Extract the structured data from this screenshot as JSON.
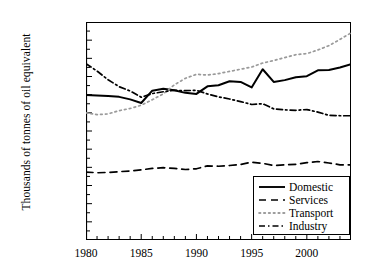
{
  "chart_data": {
    "type": "line",
    "title": "",
    "xlabel": "",
    "ylabel": "Thousands of tonnes of oil equivalent",
    "xlim": [
      1980,
      2004
    ],
    "ylim": [
      0,
      60000
    ],
    "ytick_values": [
      0,
      5000,
      10000,
      15000,
      20000,
      25000,
      30000,
      35000,
      40000,
      45000,
      50000,
      55000,
      60000
    ],
    "ytick_labels": [
      "0",
      "5000",
      "10000",
      "15000",
      "20000",
      "25000",
      "30000",
      "35000",
      "40000",
      "45000",
      "50000",
      "55000",
      "60000"
    ],
    "ytick_minor_step": 2500,
    "xtick_values": [
      1980,
      1985,
      1990,
      1995,
      2000
    ],
    "xtick_labels": [
      "1980",
      "1985",
      "1990",
      "1995",
      "2000"
    ],
    "xtick_minor_step": 1,
    "grid": false,
    "legend_position": "lower right",
    "x": [
      1980,
      1981,
      1982,
      1983,
      1984,
      1985,
      1986,
      1987,
      1988,
      1989,
      1990,
      1991,
      1992,
      1993,
      1994,
      1995,
      1996,
      1997,
      1998,
      1999,
      2000,
      2001,
      2002,
      2003,
      2004
    ],
    "series": [
      {
        "name": "Domestic",
        "style": "solid",
        "color": "#000000",
        "values": [
          39900,
          39800,
          39600,
          39400,
          38700,
          37700,
          41100,
          41600,
          41200,
          40500,
          40200,
          42300,
          42600,
          43700,
          43500,
          42000,
          47000,
          43500,
          44000,
          44800,
          45100,
          46700,
          46800,
          47500,
          48400
        ]
      },
      {
        "name": "Services",
        "style": "dashed",
        "color": "#000000",
        "values": [
          18700,
          18500,
          18600,
          18800,
          19000,
          19300,
          19700,
          19900,
          19700,
          19400,
          19600,
          20400,
          20300,
          20500,
          20800,
          21400,
          21100,
          20500,
          20700,
          20800,
          21300,
          21600,
          21200,
          20700,
          20700
        ]
      },
      {
        "name": "Transport",
        "style": "dotted",
        "color": "#9a9a9a",
        "values": [
          35000,
          34500,
          34700,
          35600,
          36200,
          37100,
          38600,
          40200,
          42700,
          44500,
          45600,
          45400,
          45800,
          46400,
          47000,
          47600,
          48700,
          49400,
          50200,
          51000,
          51300,
          52300,
          53500,
          55200,
          57000
        ]
      },
      {
        "name": "Industry",
        "style": "dashdot",
        "color": "#000000",
        "values": [
          48500,
          46500,
          44100,
          42200,
          41000,
          39300,
          40300,
          40800,
          41200,
          41100,
          41200,
          40200,
          39400,
          38800,
          38100,
          37300,
          37500,
          36100,
          35800,
          35700,
          35900,
          35200,
          34300,
          34200,
          34200
        ]
      }
    ]
  },
  "legend": {
    "items": [
      {
        "label": "Domestic"
      },
      {
        "label": "Services"
      },
      {
        "label": "Transport"
      },
      {
        "label": "Industry"
      }
    ]
  }
}
